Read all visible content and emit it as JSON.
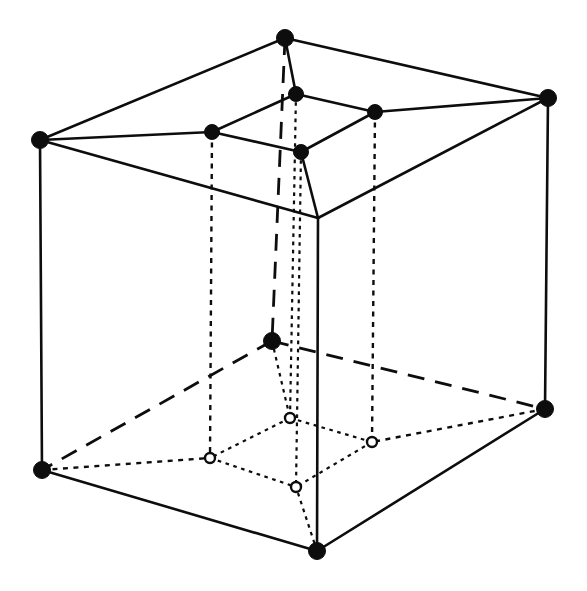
{
  "figure": {
    "title": "Nested cube (tesseract) projection line drawing",
    "canvas": {
      "width": 587,
      "height": 591,
      "background": "#ffffff"
    },
    "ink_color": "#0d0d0d",
    "line_styles": {
      "solid": "solid",
      "long_dash": "long-dash",
      "dotted": "dotted",
      "fine_dotted": "fine-dotted"
    }
  },
  "chart_data": {
    "type": "diagram",
    "title": "Nested cube (tesseract) projection line drawing",
    "xlabel": "",
    "ylabel": "",
    "grid": false,
    "legend": "none",
    "xlim": [
      0,
      587
    ],
    "ylim": [
      0,
      591
    ],
    "vertex_marker_types": [
      "filled-circle",
      "open-circle"
    ],
    "vertices": [
      {
        "id": "O_top_back",
        "group": "outer",
        "label": "",
        "x": 285,
        "y": 38,
        "marker": "filled-circle",
        "radius": 8.5
      },
      {
        "id": "O_top_left",
        "group": "outer",
        "label": "",
        "x": 40,
        "y": 140,
        "marker": "filled-circle",
        "radius": 8.5
      },
      {
        "id": "O_top_right",
        "group": "outer",
        "label": "",
        "x": 548,
        "y": 98,
        "marker": "filled-circle",
        "radius": 8.5
      },
      {
        "id": "O_top_front",
        "group": "outer",
        "label": "",
        "x": 318,
        "y": 218,
        "marker": "none",
        "radius": 0
      },
      {
        "id": "O_bot_back",
        "group": "outer",
        "label": "",
        "x": 272,
        "y": 341,
        "marker": "filled-circle",
        "radius": 8.5
      },
      {
        "id": "O_bot_left",
        "group": "outer",
        "label": "",
        "x": 42,
        "y": 470,
        "marker": "filled-circle",
        "radius": 8.5
      },
      {
        "id": "O_bot_right",
        "group": "outer",
        "label": "",
        "x": 545,
        "y": 409,
        "marker": "filled-circle",
        "radius": 8.5
      },
      {
        "id": "O_bot_front",
        "group": "outer",
        "label": "",
        "x": 317,
        "y": 551,
        "marker": "filled-circle",
        "radius": 8.5
      },
      {
        "id": "I_top_back",
        "group": "inner",
        "label": "",
        "x": 296,
        "y": 94,
        "marker": "filled-circle",
        "radius": 7.5
      },
      {
        "id": "I_top_left",
        "group": "inner",
        "label": "",
        "x": 212,
        "y": 132,
        "marker": "filled-circle",
        "radius": 7.5
      },
      {
        "id": "I_top_right",
        "group": "inner",
        "label": "",
        "x": 375,
        "y": 112,
        "marker": "filled-circle",
        "radius": 7.5
      },
      {
        "id": "I_top_front",
        "group": "inner",
        "label": "",
        "x": 301,
        "y": 152,
        "marker": "filled-circle",
        "radius": 7.5
      },
      {
        "id": "I_bot_back",
        "group": "inner",
        "label": "",
        "x": 290,
        "y": 418,
        "marker": "open-circle",
        "radius": 5.0
      },
      {
        "id": "I_bot_left",
        "group": "inner",
        "label": "",
        "x": 210,
        "y": 458,
        "marker": "open-circle",
        "radius": 5.0
      },
      {
        "id": "I_bot_right",
        "group": "inner",
        "label": "",
        "x": 372,
        "y": 442,
        "marker": "open-circle",
        "radius": 5.0
      },
      {
        "id": "I_bot_front",
        "group": "inner",
        "label": "",
        "x": 296,
        "y": 487,
        "marker": "open-circle",
        "radius": 5.0
      }
    ],
    "edges": [
      {
        "from": "O_top_back",
        "to": "O_top_left",
        "style": "solid"
      },
      {
        "from": "O_top_back",
        "to": "O_top_right",
        "style": "solid"
      },
      {
        "from": "O_top_left",
        "to": "O_top_front",
        "style": "solid"
      },
      {
        "from": "O_top_right",
        "to": "O_top_front",
        "style": "solid"
      },
      {
        "from": "O_top_left",
        "to": "O_bot_left",
        "style": "solid"
      },
      {
        "from": "O_top_right",
        "to": "O_bot_right",
        "style": "solid"
      },
      {
        "from": "O_top_front",
        "to": "O_bot_front",
        "style": "solid"
      },
      {
        "from": "O_top_back",
        "to": "O_bot_back",
        "style": "long-dash"
      },
      {
        "from": "O_bot_back",
        "to": "O_bot_left",
        "style": "long-dash"
      },
      {
        "from": "O_bot_back",
        "to": "O_bot_right",
        "style": "long-dash"
      },
      {
        "from": "O_bot_left",
        "to": "O_bot_front",
        "style": "solid"
      },
      {
        "from": "O_bot_right",
        "to": "O_bot_front",
        "style": "solid"
      },
      {
        "from": "I_top_back",
        "to": "I_top_left",
        "style": "solid"
      },
      {
        "from": "I_top_back",
        "to": "I_top_right",
        "style": "solid"
      },
      {
        "from": "I_top_left",
        "to": "I_top_front",
        "style": "solid"
      },
      {
        "from": "I_top_right",
        "to": "I_top_front",
        "style": "solid"
      },
      {
        "from": "I_top_left",
        "to": "I_bot_left",
        "style": "dotted"
      },
      {
        "from": "I_top_right",
        "to": "I_bot_right",
        "style": "dotted"
      },
      {
        "from": "I_top_front",
        "to": "I_bot_front",
        "style": "fine-dotted"
      },
      {
        "from": "I_top_back",
        "to": "I_bot_back",
        "style": "fine-dotted"
      },
      {
        "from": "I_bot_back",
        "to": "I_bot_left",
        "style": "fine-dotted"
      },
      {
        "from": "I_bot_back",
        "to": "I_bot_right",
        "style": "fine-dotted"
      },
      {
        "from": "I_bot_left",
        "to": "I_bot_front",
        "style": "fine-dotted"
      },
      {
        "from": "I_bot_right",
        "to": "I_bot_front",
        "style": "fine-dotted"
      },
      {
        "from": "O_top_back",
        "to": "I_top_back",
        "style": "solid"
      },
      {
        "from": "O_top_left",
        "to": "I_top_left",
        "style": "solid"
      },
      {
        "from": "O_top_right",
        "to": "I_top_right",
        "style": "solid"
      },
      {
        "from": "O_top_front",
        "to": "I_top_front",
        "style": "solid"
      },
      {
        "from": "O_bot_back",
        "to": "I_bot_back",
        "style": "fine-dotted"
      },
      {
        "from": "O_bot_left",
        "to": "I_bot_left",
        "style": "dotted"
      },
      {
        "from": "O_bot_right",
        "to": "I_bot_right",
        "style": "dotted"
      },
      {
        "from": "O_bot_front",
        "to": "I_bot_front",
        "style": "fine-dotted"
      }
    ],
    "annotations": []
  }
}
